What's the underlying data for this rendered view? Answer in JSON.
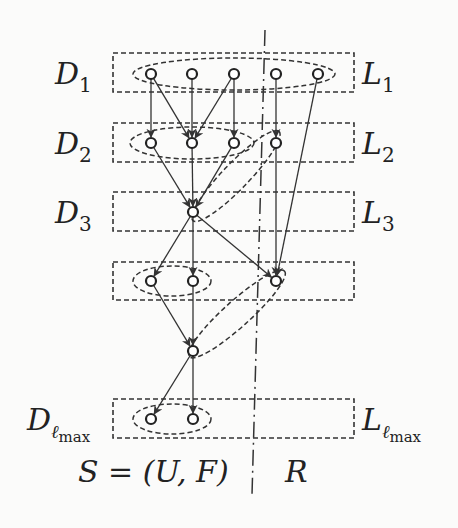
{
  "diagram": {
    "levels": [
      {
        "id": "1",
        "left_label": "D",
        "left_sub": "1",
        "right_label": "L",
        "right_sub": "1",
        "box": {
          "x": 113,
          "y": 53,
          "w": 241,
          "h": 39
        }
      },
      {
        "id": "2",
        "left_label": "D",
        "left_sub": "2",
        "right_label": "L",
        "right_sub": "2",
        "box": {
          "x": 113,
          "y": 123,
          "w": 241,
          "h": 39
        }
      },
      {
        "id": "3",
        "left_label": "D",
        "left_sub": "3",
        "right_label": "L",
        "right_sub": "3",
        "box": {
          "x": 113,
          "y": 192,
          "w": 241,
          "h": 39
        }
      },
      {
        "id": "4",
        "left_label": "",
        "left_sub": "",
        "right_label": "",
        "right_sub": "",
        "box": {
          "x": 113,
          "y": 262,
          "w": 241,
          "h": 38
        }
      },
      {
        "id": "max",
        "left_label": "D",
        "left_sub": "ℓ",
        "left_subsub": "max",
        "right_label": "L",
        "right_sub": "ℓ",
        "right_subsub": "max",
        "box": {
          "x": 113,
          "y": 399,
          "w": 241,
          "h": 39
        }
      }
    ],
    "nodes": [
      {
        "id": "a1",
        "x": 151,
        "y": 74
      },
      {
        "id": "a2",
        "x": 192,
        "y": 74
      },
      {
        "id": "a3",
        "x": 234,
        "y": 74
      },
      {
        "id": "a4",
        "x": 276,
        "y": 74
      },
      {
        "id": "a5",
        "x": 318,
        "y": 74
      },
      {
        "id": "b1",
        "x": 151,
        "y": 143
      },
      {
        "id": "b2",
        "x": 192,
        "y": 143
      },
      {
        "id": "b3",
        "x": 234,
        "y": 143
      },
      {
        "id": "b4",
        "x": 276,
        "y": 143
      },
      {
        "id": "c1",
        "x": 193,
        "y": 212
      },
      {
        "id": "d1",
        "x": 151,
        "y": 281
      },
      {
        "id": "d2",
        "x": 193,
        "y": 281
      },
      {
        "id": "d3",
        "x": 276,
        "y": 281
      },
      {
        "id": "e1",
        "x": 193,
        "y": 351
      },
      {
        "id": "f1",
        "x": 151,
        "y": 419
      },
      {
        "id": "f2",
        "x": 193,
        "y": 419
      }
    ],
    "edges": [
      [
        "a1",
        "b1"
      ],
      [
        "a1",
        "b2"
      ],
      [
        "a2",
        "b2"
      ],
      [
        "a3",
        "b2"
      ],
      [
        "a3",
        "b3"
      ],
      [
        "a4",
        "b4"
      ],
      [
        "a5",
        "d3"
      ],
      [
        "b1",
        "c1"
      ],
      [
        "b2",
        "c1"
      ],
      [
        "b3",
        "c1"
      ],
      [
        "b4",
        "d3"
      ],
      [
        "c1",
        "d1"
      ],
      [
        "c1",
        "d2"
      ],
      [
        "c1",
        "d3"
      ],
      [
        "d1",
        "e1"
      ],
      [
        "d2",
        "e1"
      ],
      [
        "e1",
        "f1"
      ],
      [
        "e1",
        "f2"
      ]
    ],
    "ellipses": [
      {
        "cx": 234,
        "cy": 74,
        "rx": 101,
        "ry": 16,
        "rot": 0
      },
      {
        "cx": 192,
        "cy": 143,
        "rx": 62,
        "ry": 16,
        "rot": 0
      },
      {
        "cx": 236,
        "cy": 176,
        "rx": 62,
        "ry": 13,
        "rot": -46
      },
      {
        "cx": 172,
        "cy": 281,
        "rx": 39,
        "ry": 15,
        "rot": 0
      },
      {
        "cx": 237,
        "cy": 314,
        "rx": 64,
        "ry": 13,
        "rot": -42
      },
      {
        "cx": 172,
        "cy": 419,
        "rx": 39,
        "ry": 15,
        "rot": 0
      }
    ],
    "divider": {
      "x1": 265,
      "y1": 30,
      "x2": 252,
      "y2": 495
    },
    "bottom": {
      "left_label": "S = (U, F)",
      "right_label": "R"
    }
  }
}
